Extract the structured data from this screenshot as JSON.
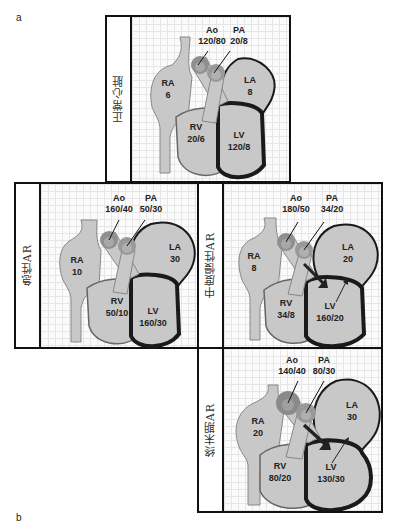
{
  "panel_labels": {
    "a": "a",
    "b": "b"
  },
  "colors": {
    "chamber_fill": "#c8c8c8",
    "chamber_stroke": "#777777",
    "lv_wall": "#1a1a1a",
    "valve_fill": "#8f8f8f",
    "valve_inner": "#a8a8a8",
    "grid_line": "#e6e6e6",
    "flow_arrow": "#d4d4d4",
    "border": "#111111"
  },
  "panels": [
    {
      "id": "normal",
      "label": "正常心脏",
      "Ao": {
        "name": "Ao",
        "value": "120/80"
      },
      "PA": {
        "name": "PA",
        "value": "20/8"
      },
      "RA": {
        "name": "RA",
        "value": "6"
      },
      "LA": {
        "name": "LA",
        "value": "8"
      },
      "RV": {
        "name": "RV",
        "value": "20/6"
      },
      "LV": {
        "name": "LV",
        "value": "120/8"
      }
    },
    {
      "id": "acute-ar",
      "label": "急性AR",
      "Ao": {
        "name": "Ao",
        "value": "160/40"
      },
      "PA": {
        "name": "PA",
        "value": "50/30"
      },
      "RA": {
        "name": "RA",
        "value": "10"
      },
      "LA": {
        "name": "LA",
        "value": "30"
      },
      "RV": {
        "name": "RV",
        "value": "50/10"
      },
      "LV": {
        "name": "LV",
        "value": "160/30"
      }
    },
    {
      "id": "chronic-moderate-ar",
      "label": "中度慢性AR",
      "Ao": {
        "name": "Ao",
        "value": "180/50"
      },
      "PA": {
        "name": "PA",
        "value": "34/20"
      },
      "RA": {
        "name": "RA",
        "value": "8"
      },
      "LA": {
        "name": "LA",
        "value": "20"
      },
      "RV": {
        "name": "RV",
        "value": "34/8"
      },
      "LV": {
        "name": "LV",
        "value": "160/20"
      }
    },
    {
      "id": "end-stage-ar",
      "label": "终末期AR",
      "Ao": {
        "name": "Ao",
        "value": "140/40"
      },
      "PA": {
        "name": "PA",
        "value": "80/30"
      },
      "RA": {
        "name": "RA",
        "value": "20"
      },
      "LA": {
        "name": "LA",
        "value": "30"
      },
      "RV": {
        "name": "RV",
        "value": "80/20"
      },
      "LV": {
        "name": "LV",
        "value": "130/30"
      }
    }
  ]
}
